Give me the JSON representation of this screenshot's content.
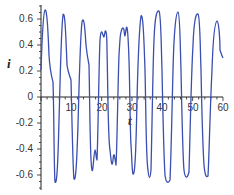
{
  "chart_data": {
    "type": "line",
    "title": "",
    "xlabel": "t",
    "ylabel": "i",
    "xlim": [
      0,
      60
    ],
    "ylim": [
      -0.7,
      0.7
    ],
    "grid": false,
    "legend": null,
    "x_ticks": [
      "10",
      "20",
      "30",
      "40",
      "50",
      "60"
    ],
    "y_ticks": [
      "0.6",
      "0.4",
      "0.2",
      "0",
      "-0.2",
      "-0.4",
      "-0.6"
    ],
    "line_color": "#3b4fb0",
    "series": [
      {
        "name": "i(t)",
        "x": [
          0,
          1.3,
          2.4,
          3.3,
          4.5,
          7.6,
          8.6,
          9.9,
          10.9,
          13.9,
          14.7,
          16.2,
          17.2,
          19.8,
          20.8,
          21.5,
          22.3,
          23.6,
          26.7,
          27.4,
          28.1,
          29.0,
          30.0,
          33.3,
          34.5,
          36.5,
          38.2,
          39.6,
          42.6,
          44.0,
          45.1,
          48.8,
          50.6,
          51.6,
          55.1,
          56.6,
          57.8,
          60
        ],
        "y": [
          0.3,
          0.67,
          0.3,
          0.12,
          -0.66,
          0.64,
          0.17,
          0.0,
          -0.64,
          0.6,
          0.35,
          0.0,
          -0.57,
          0.52,
          0.47,
          0.5,
          0.0,
          -0.53,
          0.45,
          0.5,
          0.54,
          0.0,
          -0.58,
          0.58,
          0.0,
          -0.64,
          0.66,
          0.0,
          -0.67,
          0.66,
          0.0,
          -0.64,
          0.65,
          0.0,
          -0.62,
          0.59,
          0.3,
          0.2
        ]
      }
    ]
  }
}
